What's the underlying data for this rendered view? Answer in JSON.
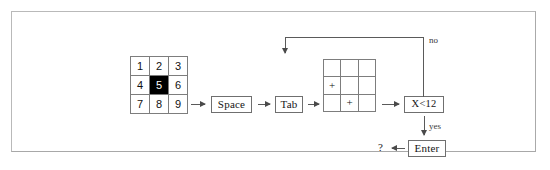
{
  "figure": {
    "type": "flowchart"
  },
  "grids": {
    "numbers": {
      "name": "number-grid",
      "rows": 3,
      "cols": 3,
      "cells": [
        {
          "label": "1",
          "filled": false
        },
        {
          "label": "2",
          "filled": false
        },
        {
          "label": "3",
          "filled": false
        },
        {
          "label": "4",
          "filled": false
        },
        {
          "label": "5",
          "filled": true
        },
        {
          "label": "6",
          "filled": false
        },
        {
          "label": "7",
          "filled": false
        },
        {
          "label": "8",
          "filled": false
        },
        {
          "label": "9",
          "filled": false
        }
      ]
    },
    "plus": {
      "name": "plus-grid",
      "rows": 3,
      "cols": 3,
      "cells": [
        {
          "label": "",
          "filled": false
        },
        {
          "label": "",
          "filled": false
        },
        {
          "label": "",
          "filled": false
        },
        {
          "label": "+",
          "filled": false
        },
        {
          "label": "",
          "filled": false
        },
        {
          "label": "",
          "filled": false
        },
        {
          "label": "",
          "filled": false
        },
        {
          "label": "+",
          "filled": false
        },
        {
          "label": "",
          "filled": false
        }
      ]
    }
  },
  "nodes": {
    "space": "Space",
    "tab": "Tab",
    "condition": "X<12",
    "enter": "Enter",
    "question": "?"
  },
  "edge_labels": {
    "no": "no",
    "yes": "yes"
  },
  "colors": {
    "ink": "#111111",
    "line": "#5a5a5a",
    "box_border": "#6f6f6f",
    "grid_line": "#7d7d7d",
    "highlight_fill": "#000000",
    "highlight_text": "#ffffff",
    "page_border": "#b9b9b9",
    "background": "#ffffff"
  }
}
